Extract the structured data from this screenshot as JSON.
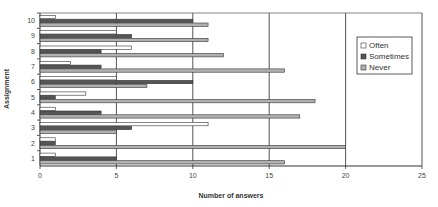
{
  "chart_data": {
    "type": "bar",
    "orientation": "horizontal",
    "title": "",
    "xlabel": "Number of answers",
    "ylabel": "Assignment",
    "categories": [
      "1",
      "2",
      "3",
      "4",
      "5",
      "6",
      "7",
      "8",
      "9",
      "10"
    ],
    "series": [
      {
        "name": "Often",
        "color": "#ffffff",
        "values": [
          1,
          1,
          11,
          1,
          3,
          5,
          2,
          6,
          5,
          1
        ]
      },
      {
        "name": "Sometimes",
        "color": "#555555",
        "values": [
          5,
          1,
          6,
          4,
          1,
          10,
          4,
          4,
          6,
          10
        ]
      },
      {
        "name": "Never",
        "color": "#b0b0b0",
        "values": [
          16,
          20,
          5,
          17,
          18,
          7,
          16,
          12,
          11,
          11
        ]
      }
    ],
    "xlim": [
      0,
      25
    ],
    "xticks": [
      0,
      5,
      10,
      15,
      20,
      25
    ],
    "grid": {
      "vertical": true,
      "horizontal": false
    },
    "legend": {
      "position": "right",
      "entries": [
        "Often",
        "Sometimes",
        "Never"
      ]
    }
  }
}
